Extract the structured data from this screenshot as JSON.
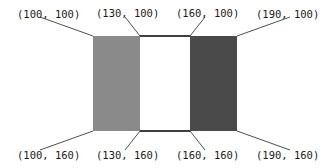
{
  "diagram": {
    "shapes": [
      {
        "name": "left-rect",
        "fill": "#8a8a8a"
      },
      {
        "name": "right-rect",
        "fill": "#4a4a4a"
      }
    ],
    "labels": {
      "top": [
        "(100, 100)",
        "(130, 100)",
        "(160, 100)",
        "(190, 100)"
      ],
      "bottom": [
        "(100, 160)",
        "(130, 160)",
        "(160, 160)",
        "(190, 160)"
      ]
    }
  }
}
